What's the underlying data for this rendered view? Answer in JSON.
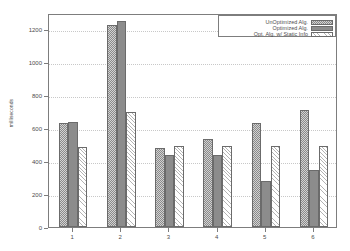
{
  "chart_data": {
    "type": "bar",
    "title": "",
    "xlabel": "",
    "ylabel": "milliseconds",
    "categories": [
      "1",
      "2",
      "3",
      "4",
      "5",
      "6"
    ],
    "ylim": [
      0,
      1300
    ],
    "yticks": [
      0,
      200,
      400,
      600,
      800,
      1000,
      1200
    ],
    "ytick_labels": [
      "0",
      "200",
      "400",
      "600",
      "800",
      "1000",
      "1200"
    ],
    "grid": true,
    "legend_position": "top-right",
    "series": [
      {
        "name": "UnOptimized Alg.",
        "pattern": "checkerboard",
        "color": "#d2d2d2",
        "values": [
          630,
          1225,
          480,
          535,
          630,
          710
        ]
      },
      {
        "name": "Optimized Alg.",
        "pattern": "solid",
        "color": "#8c8c8c",
        "values": [
          640,
          1250,
          435,
          440,
          280,
          345
        ]
      },
      {
        "name": "Opt. Alg. w/ Static Info",
        "pattern": "diagonal-hatch",
        "color": "#ffffff",
        "values": [
          485,
          700,
          495,
          495,
          490,
          490
        ]
      }
    ]
  },
  "axes": {
    "frame_color": "#7d7d7d",
    "grid_color": "#c8c8c8",
    "tick_label_color": "#4d4d4d"
  }
}
